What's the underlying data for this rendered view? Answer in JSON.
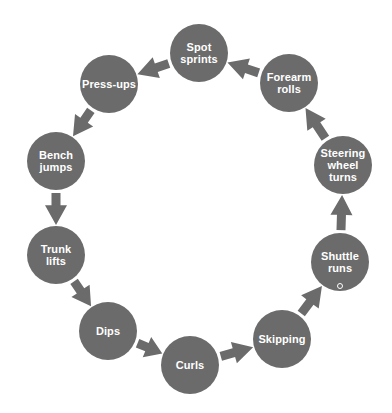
{
  "diagram": {
    "type": "circuit-training-cycle",
    "colors": {
      "node": "#6b6b6b",
      "arrow": "#6b6b6b",
      "text": "#ffffff",
      "background": "#ffffff"
    },
    "node_radius": 29,
    "nodes": [
      {
        "id": "spot-sprints",
        "label": "Spot\nsprints",
        "cx": 199,
        "cy": 53
      },
      {
        "id": "press-ups",
        "label": "Press-ups",
        "cx": 109,
        "cy": 84
      },
      {
        "id": "bench-jumps",
        "label": "Bench\njumps",
        "cx": 56,
        "cy": 161
      },
      {
        "id": "trunk-lifts",
        "label": "Trunk\nlifts",
        "cx": 56,
        "cy": 255
      },
      {
        "id": "dips",
        "label": "Dips",
        "cx": 108,
        "cy": 331
      },
      {
        "id": "curls",
        "label": "Curls",
        "cx": 190,
        "cy": 365
      },
      {
        "id": "skipping",
        "label": "Skipping",
        "cx": 282,
        "cy": 339
      },
      {
        "id": "shuttle-runs",
        "label": "Shuttle\nruns",
        "cx": 340,
        "cy": 262
      },
      {
        "id": "steering-wheel-turns",
        "label": "Steering\nwheel\nturns",
        "cx": 343,
        "cy": 165
      },
      {
        "id": "forearm-rolls",
        "label": "Forearm\nrolls",
        "cx": 289,
        "cy": 83
      }
    ],
    "edges": [
      {
        "from": "spot-sprints",
        "to": "press-ups"
      },
      {
        "from": "press-ups",
        "to": "bench-jumps"
      },
      {
        "from": "bench-jumps",
        "to": "trunk-lifts"
      },
      {
        "from": "trunk-lifts",
        "to": "dips"
      },
      {
        "from": "dips",
        "to": "curls"
      },
      {
        "from": "curls",
        "to": "skipping"
      },
      {
        "from": "skipping",
        "to": "shuttle-runs"
      },
      {
        "from": "shuttle-runs",
        "to": "steering-wheel-turns"
      },
      {
        "from": "steering-wheel-turns",
        "to": "forearm-rolls"
      },
      {
        "from": "forearm-rolls",
        "to": "spot-sprints"
      }
    ],
    "marker": {
      "near": "shuttle-runs",
      "x": 340,
      "y": 286
    }
  }
}
